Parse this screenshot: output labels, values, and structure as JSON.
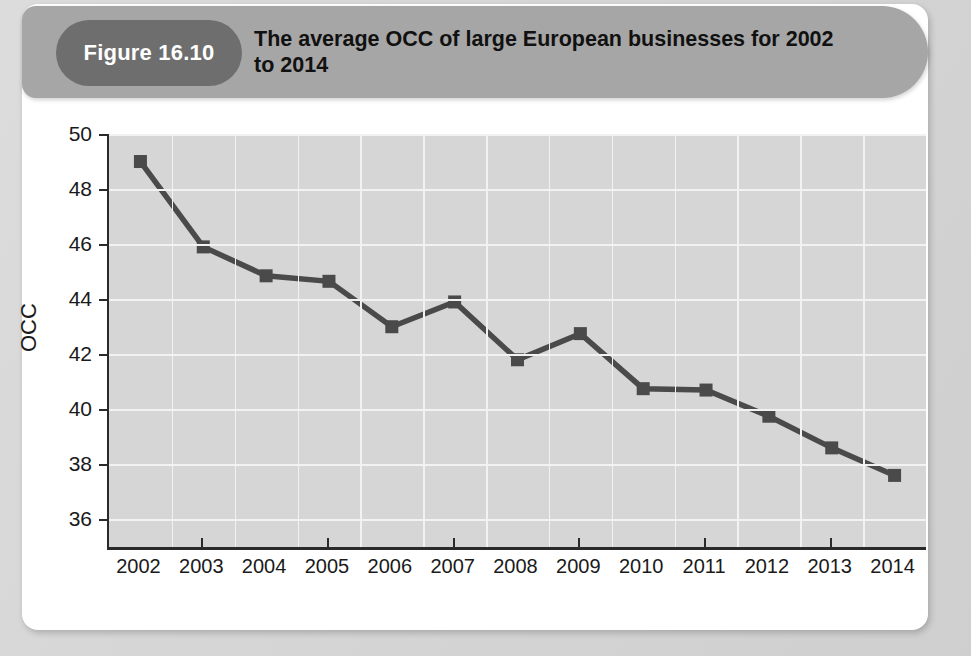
{
  "figure": {
    "badge_label": "Figure 16.10",
    "title": "The average OCC of large European businesses for 2002 to 2014",
    "badge_color": "#6e6e6e",
    "header_color": "#a6a6a6",
    "card_color": "#ffffff",
    "page_color": "#d9d9d9"
  },
  "chart_data": {
    "type": "line",
    "title": "The average OCC of large European businesses for 2002 to 2014",
    "xlabel": "",
    "ylabel": "OCC",
    "categories": [
      "2002",
      "2003",
      "2004",
      "2005",
      "2006",
      "2007",
      "2008",
      "2009",
      "2010",
      "2011",
      "2012",
      "2013",
      "2014"
    ],
    "values": [
      49.0,
      45.9,
      44.85,
      44.65,
      43.0,
      43.9,
      41.8,
      42.75,
      40.75,
      40.7,
      39.75,
      38.6,
      37.6
    ],
    "ylim": [
      35,
      50
    ],
    "yticks": [
      36,
      38,
      40,
      42,
      44,
      46,
      48,
      50
    ],
    "ytick_labels": [
      "36",
      "38",
      "40",
      "42",
      "44",
      "46",
      "48",
      "50"
    ],
    "xtick_labels": [
      "2002",
      "2003",
      "2004",
      "2005",
      "2006",
      "2007",
      "2008",
      "2009",
      "2010",
      "2011",
      "2012",
      "2013",
      "2014"
    ],
    "grid": true,
    "grid_color": "#f2f2f2",
    "plot_background": "#d6d6d6",
    "series_color": "#4a4a4a",
    "marker": "square",
    "legend": "none"
  }
}
